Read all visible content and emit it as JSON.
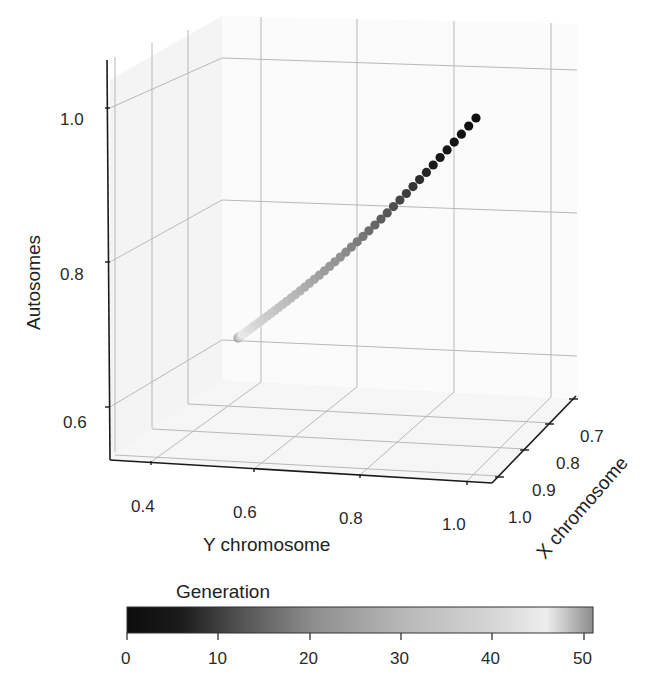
{
  "chart_data": {
    "type": "scatter3d",
    "title": "",
    "axes": {
      "x": {
        "label": "X chromosome",
        "ticks": [
          "0.7",
          "0.8",
          "0.9",
          "1.0"
        ],
        "range": [
          1.0,
          0.65
        ]
      },
      "y": {
        "label": "Y chromosome",
        "ticks": [
          "0.4",
          "0.6",
          "0.8",
          "1.0"
        ],
        "range": [
          0.33,
          1.05
        ]
      },
      "z": {
        "label": "Autosomes",
        "ticks": [
          "0.6",
          "0.8",
          "1.0"
        ],
        "range": [
          0.55,
          1.07
        ]
      }
    },
    "grid": true,
    "colorbar": {
      "label": "Generation",
      "ticks": [
        "0",
        "10",
        "20",
        "30",
        "40",
        "50"
      ],
      "range": [
        0,
        51
      ],
      "colormap": "gray (dark at 0, light near 45, mid-gray at 51)"
    },
    "series": [
      {
        "name": "trajectory",
        "n_points": 51,
        "start": {
          "generation": 0,
          "x_chromosome": 1.0,
          "y_chromosome": 1.0,
          "autosomes": 1.0,
          "color": "#111111"
        },
        "end": {
          "generation": 50,
          "x_chromosome": 0.68,
          "y_chromosome": 0.45,
          "autosomes": 0.72,
          "color": "#8a8a8a"
        },
        "note": "Points decline monotonically from (1,1,1) toward lower values with generation; dots spaced widely at early generations and densely at later ones."
      }
    ],
    "legend_position": "bottom colorbar"
  },
  "labels": {
    "z_axis": "Autosomes",
    "y_axis": "Y chromosome",
    "x_axis": "X chromosome",
    "colorbar_title": "Generation",
    "z_ticks": [
      "1.0",
      "0.8",
      "0.6"
    ],
    "y_ticks": [
      "0.4",
      "0.6",
      "0.8",
      "1.0"
    ],
    "x_ticks": [
      "0.7",
      "0.8",
      "0.9",
      "1.0"
    ],
    "cb_ticks": [
      "0",
      "10",
      "20",
      "30",
      "40",
      "50"
    ]
  }
}
